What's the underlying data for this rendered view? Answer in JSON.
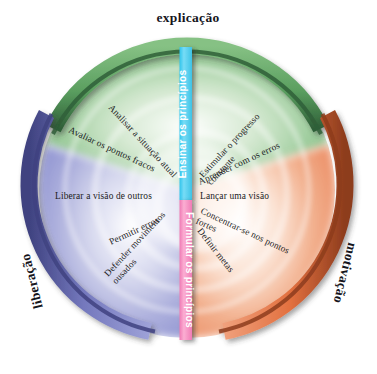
{
  "diagram": {
    "center": {
      "x": 187,
      "y": 190
    },
    "sectors": [
      {
        "id": "explicacao",
        "name": "explicação",
        "color": "#6aab6e",
        "arc_color_dark": "#2f5f38",
        "fill_color": "#8cc48e",
        "position": "top"
      },
      {
        "id": "liberacao",
        "name": "liberação",
        "color": "#8f93cf",
        "arc_color_dark": "#3c3f7d",
        "fill_color": "#a5a8d8",
        "position": "left"
      },
      {
        "id": "motivacao",
        "name": "motivação",
        "color": "#e8815a",
        "arc_color_dark": "#8a3a1c",
        "fill_color": "#ee9b76",
        "position": "right"
      }
    ],
    "bars": [
      {
        "id": "ensinar-os-principios",
        "label": "Ensinar os princípios",
        "color": "#5cd3f0",
        "orientation": "bottom-to-top",
        "position": "upper-center"
      },
      {
        "id": "formular-os-principios",
        "label": "Formular os princípios",
        "color": "#f58fc2",
        "orientation": "top-to-bottom",
        "position": "lower-center"
      }
    ],
    "spokes_left": [
      {
        "id": "analisar-a-situacao-atual",
        "label": "Analisar a situação atual",
        "lines": [
          "Analisar a situação atual"
        ]
      },
      {
        "id": "avaliar-os-pontos-fracos",
        "label": "Avaliar os pontos fracos",
        "lines": [
          "Avaliar os pontos fracos"
        ]
      },
      {
        "id": "liberar-a-visao-de-outros",
        "label": "Liberar a visão de outros",
        "lines": [
          "Liberar a visão de outros"
        ]
      },
      {
        "id": "permitir-erros",
        "label": "Permitir erros",
        "lines": [
          "Permitir erros"
        ]
      },
      {
        "id": "defender-movimentos-ousados",
        "label": "Defender movimentos ousados",
        "lines": [
          "Defender movimentos",
          "ousados"
        ]
      }
    ],
    "spokes_right": [
      {
        "id": "estimular-o-progresso-constante",
        "label": "Estimular o progresso constante",
        "lines": [
          "Estimular o progresso",
          "constante"
        ]
      },
      {
        "id": "aprender-com-os-erros",
        "label": "Aprender com os erros",
        "lines": [
          "Aprender com os erros"
        ]
      },
      {
        "id": "lancar-uma-visao",
        "label": "Lançar uma visão",
        "lines": [
          "Lançar uma visão"
        ]
      },
      {
        "id": "concentrar-se-nos-pontos-fortes",
        "label": "Concentrar-se nos pontos fortes",
        "lines": [
          "Concentrar-se nos pontos",
          "fortes"
        ]
      },
      {
        "id": "definir-metas",
        "label": "Definir metas",
        "lines": [
          "Definir metas"
        ]
      }
    ]
  }
}
